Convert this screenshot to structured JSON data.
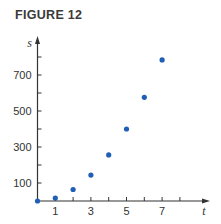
{
  "figure": {
    "title": "FIGURE 12"
  },
  "colors": {
    "point": "#1f5fb5",
    "axis": "#333333"
  },
  "chart_data": {
    "type": "scatter",
    "title": "FIGURE 12",
    "xlabel": "t",
    "ylabel": "s",
    "x": [
      0,
      1,
      2,
      3,
      4,
      5,
      6,
      7
    ],
    "values": [
      0,
      16,
      64,
      144,
      256,
      400,
      576,
      784
    ],
    "xticks": [
      1,
      2,
      3,
      4,
      5,
      6,
      7,
      8
    ],
    "xtick_labels": [
      "1",
      "3",
      "5",
      "7"
    ],
    "yticks": [
      100,
      200,
      300,
      400,
      500,
      600,
      700,
      800
    ],
    "ytick_labels": [
      "100",
      "300",
      "500",
      "700"
    ],
    "xlim": [
      0,
      8.5
    ],
    "ylim": [
      0,
      840
    ],
    "grid": false,
    "legend": null
  }
}
